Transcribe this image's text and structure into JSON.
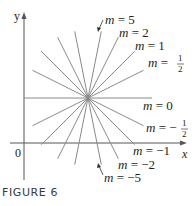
{
  "figure": {
    "caption": "FIGURE 6",
    "axes": {
      "x_label": "x",
      "y_label": "y",
      "origin_label": "0"
    },
    "center": {
      "x": 88,
      "y": 98
    },
    "line_color": "#8a8a8a",
    "axis_color": "#555555",
    "lines": [
      {
        "slope_label": "m = 5",
        "m": 5
      },
      {
        "slope_label": "m = 2",
        "m": 2
      },
      {
        "slope_label": "m = 1",
        "m": 1
      },
      {
        "slope_label": "m = 1/2",
        "m": 0.5
      },
      {
        "slope_label": "m = 0",
        "m": 0
      },
      {
        "slope_label": "m = −1/2",
        "m": -0.5
      },
      {
        "slope_label": "m = −1",
        "m": -1
      },
      {
        "slope_label": "m = −2",
        "m": -2
      },
      {
        "slope_label": "m = −5",
        "m": -5
      }
    ],
    "labels": {
      "m5": {
        "m": "m",
        "eq": " = 5"
      },
      "m2": {
        "m": "m",
        "eq": " = 2"
      },
      "m1": {
        "m": "m",
        "eq": " = 1"
      },
      "mhalf": {
        "m": "m",
        "eq": " = ",
        "num": "1",
        "den": "2"
      },
      "m0": {
        "m": "m",
        "eq": " = 0"
      },
      "mneghalf": {
        "m": "m",
        "eq": " = −",
        "num": "1",
        "den": "2"
      },
      "mneg1": {
        "m": "m",
        "eq": " = −1"
      },
      "mneg2": {
        "m": "m",
        "eq": " = −2"
      },
      "mneg5": {
        "m": "m",
        "eq": " = −5"
      }
    }
  }
}
